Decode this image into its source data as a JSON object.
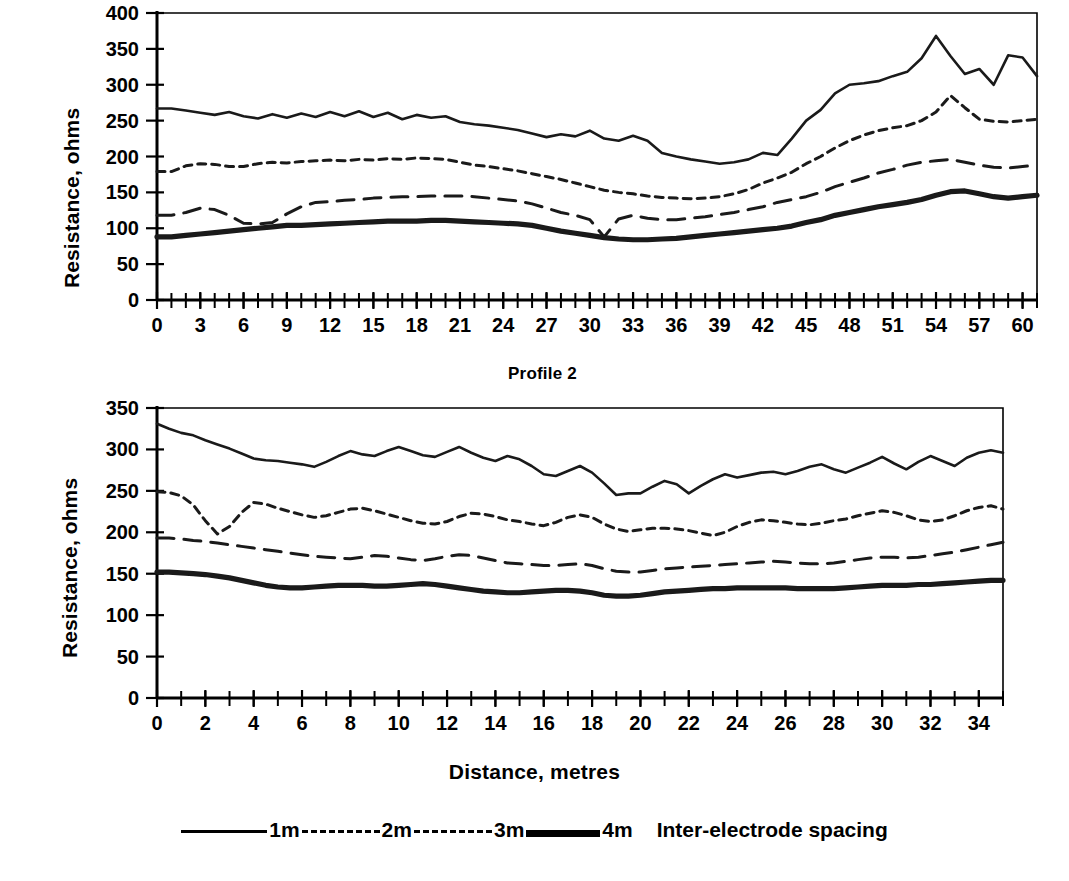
{
  "figure": {
    "xlabel": "Distance, metres",
    "legend_note": "Inter-electrode spacing",
    "legend": [
      {
        "key": "1m",
        "label": "1m",
        "style": "solid-thin"
      },
      {
        "key": "2m",
        "label": "2m",
        "style": "dotted"
      },
      {
        "key": "3m",
        "label": "3m",
        "style": "dashed"
      },
      {
        "key": "4m",
        "label": "4m",
        "style": "solid-thick"
      }
    ]
  },
  "chart_data": [
    {
      "id": "profile-1",
      "type": "line",
      "title": "",
      "xlabel": "",
      "ylabel": "Resistance, ohms",
      "xlim": [
        0,
        61
      ],
      "ylim": [
        0,
        400
      ],
      "yticks": [
        0,
        50,
        100,
        150,
        200,
        250,
        300,
        350,
        400
      ],
      "xticks": [
        0,
        3,
        6,
        9,
        12,
        15,
        18,
        21,
        24,
        27,
        30,
        33,
        36,
        39,
        42,
        45,
        48,
        51,
        54,
        57,
        60
      ],
      "xtick_minor_step": 1,
      "grid": false,
      "legend_position": "below-figure",
      "x": [
        0,
        1,
        2,
        3,
        4,
        5,
        6,
        7,
        8,
        9,
        10,
        11,
        12,
        13,
        14,
        15,
        16,
        17,
        18,
        19,
        20,
        21,
        22,
        23,
        24,
        25,
        26,
        27,
        28,
        29,
        30,
        31,
        32,
        33,
        34,
        35,
        36,
        37,
        38,
        39,
        40,
        41,
        42,
        43,
        44,
        45,
        46,
        47,
        48,
        49,
        50,
        51,
        52,
        53,
        54,
        55,
        56,
        57,
        58,
        59,
        60,
        61
      ],
      "series": [
        {
          "name": "1m",
          "values": [
            267,
            267,
            264,
            261,
            258,
            262,
            256,
            253,
            259,
            254,
            260,
            255,
            262,
            256,
            263,
            255,
            261,
            252,
            258,
            254,
            256,
            248,
            245,
            243,
            240,
            237,
            232,
            227,
            231,
            228,
            236,
            225,
            222,
            229,
            222,
            205,
            200,
            196,
            193,
            190,
            192,
            196,
            205,
            202,
            225,
            250,
            265,
            288,
            300,
            302,
            305,
            312,
            318,
            337,
            368,
            340,
            315,
            322,
            300,
            341,
            338,
            312,
            295,
            283,
            262,
            232,
            228,
            235,
            240,
            250,
            272,
            295,
            312,
            318,
            328,
            320,
            310,
            322,
            340,
            338,
            330,
            352,
            357,
            323
          ]
        },
        {
          "name": "2m",
          "values": [
            179,
            179,
            187,
            190,
            189,
            186,
            186,
            190,
            192,
            191,
            193,
            194,
            195,
            194,
            196,
            195,
            197,
            196,
            198,
            197,
            196,
            192,
            188,
            186,
            183,
            180,
            176,
            172,
            168,
            163,
            158,
            153,
            150,
            148,
            145,
            143,
            142,
            141,
            142,
            144,
            148,
            154,
            163,
            170,
            178,
            190,
            200,
            212,
            222,
            230,
            236,
            240,
            243,
            250,
            262,
            285,
            268,
            252,
            249,
            248,
            250,
            252,
            246,
            240,
            228,
            214,
            205,
            197,
            198,
            204,
            212,
            222,
            232,
            240,
            248,
            252,
            254,
            253,
            252,
            255,
            258,
            260,
            262,
            263
          ]
        },
        {
          "name": "3m",
          "values": [
            118,
            118,
            122,
            128,
            126,
            118,
            107,
            106,
            108,
            120,
            130,
            136,
            137,
            139,
            140,
            142,
            143,
            144,
            144,
            145,
            145,
            145,
            144,
            142,
            140,
            138,
            134,
            128,
            122,
            118,
            112,
            88,
            113,
            118,
            114,
            112,
            112,
            114,
            116,
            119,
            122,
            126,
            130,
            136,
            140,
            144,
            150,
            158,
            164,
            170,
            177,
            182,
            188,
            192,
            194,
            196,
            192,
            188,
            185,
            184,
            186,
            188,
            190,
            184,
            176,
            166,
            162,
            161,
            162,
            166,
            172,
            178,
            180,
            182,
            184,
            186,
            186,
            185,
            184,
            186,
            190,
            196,
            206,
            217
          ]
        },
        {
          "name": "4m",
          "values": [
            88,
            88,
            90,
            92,
            94,
            96,
            98,
            100,
            102,
            104,
            104,
            105,
            106,
            107,
            108,
            109,
            110,
            110,
            110,
            111,
            111,
            110,
            109,
            108,
            107,
            106,
            104,
            100,
            96,
            93,
            90,
            87,
            85,
            84,
            84,
            85,
            86,
            88,
            90,
            92,
            94,
            96,
            98,
            100,
            103,
            108,
            112,
            118,
            122,
            126,
            130,
            133,
            136,
            140,
            146,
            151,
            152,
            148,
            144,
            142,
            144,
            146,
            148,
            146,
            140,
            133,
            129,
            128,
            130,
            134,
            138,
            142,
            146,
            148,
            150,
            151,
            151,
            150,
            150,
            152,
            154,
            160,
            170,
            180
          ]
        }
      ]
    },
    {
      "id": "profile-2",
      "type": "line",
      "title": "Profile 2",
      "xlabel": "Distance, metres",
      "ylabel": "Resistance, ohms",
      "xlim": [
        0,
        35
      ],
      "ylim": [
        0,
        350
      ],
      "yticks": [
        0,
        50,
        100,
        150,
        200,
        250,
        300,
        350
      ],
      "xticks": [
        0,
        2,
        4,
        6,
        8,
        10,
        12,
        14,
        16,
        18,
        20,
        22,
        24,
        26,
        28,
        30,
        32,
        34
      ],
      "xtick_minor_step": 1,
      "grid": false,
      "legend_position": "below-figure",
      "x": [
        0,
        0.5,
        1,
        1.5,
        2,
        2.5,
        3,
        3.5,
        4,
        4.5,
        5,
        5.5,
        6,
        6.5,
        7,
        7.5,
        8,
        8.5,
        9,
        9.5,
        10,
        10.5,
        11,
        11.5,
        12,
        12.5,
        13,
        13.5,
        14,
        14.5,
        15,
        15.5,
        16,
        16.5,
        17,
        17.5,
        18,
        18.5,
        19,
        19.5,
        20,
        20.5,
        21,
        21.5,
        22,
        22.5,
        23,
        23.5,
        24,
        24.5,
        25,
        25.5,
        26,
        26.5,
        27,
        27.5,
        28,
        28.5,
        29,
        29.5,
        30,
        30.5,
        31,
        31.5,
        32,
        32.5,
        33,
        33.5,
        34,
        34.5,
        35
      ],
      "series": [
        {
          "name": "1m",
          "values": [
            331,
            325,
            320,
            317,
            311,
            306,
            301,
            295,
            289,
            287,
            286,
            284,
            282,
            279,
            285,
            292,
            298,
            294,
            292,
            298,
            303,
            298,
            293,
            291,
            297,
            303,
            296,
            290,
            286,
            292,
            288,
            280,
            270,
            268,
            274,
            280,
            272,
            259,
            245,
            247,
            247,
            255,
            262,
            258,
            247,
            256,
            264,
            270,
            266,
            269,
            272,
            273,
            270,
            274,
            279,
            282,
            276,
            272,
            278,
            284,
            291,
            283,
            276,
            285,
            292,
            286,
            280,
            290,
            296,
            299,
            296
          ]
        },
        {
          "name": "2m",
          "values": [
            249,
            248,
            244,
            233,
            214,
            198,
            207,
            224,
            236,
            234,
            229,
            225,
            221,
            218,
            220,
            224,
            228,
            229,
            226,
            222,
            218,
            214,
            211,
            210,
            213,
            219,
            223,
            222,
            219,
            215,
            213,
            210,
            208,
            212,
            218,
            221,
            218,
            210,
            204,
            201,
            203,
            205,
            205,
            204,
            202,
            199,
            196,
            200,
            207,
            212,
            215,
            214,
            212,
            210,
            209,
            211,
            214,
            216,
            220,
            223,
            226,
            224,
            220,
            215,
            213,
            215,
            220,
            226,
            230,
            232,
            228
          ]
        },
        {
          "name": "3m",
          "values": [
            193,
            193,
            192,
            190,
            189,
            187,
            185,
            183,
            181,
            179,
            177,
            175,
            173,
            171,
            170,
            169,
            168,
            170,
            172,
            171,
            169,
            167,
            166,
            168,
            171,
            173,
            172,
            169,
            166,
            163,
            162,
            161,
            160,
            160,
            161,
            162,
            160,
            156,
            153,
            152,
            152,
            154,
            156,
            157,
            158,
            159,
            160,
            161,
            162,
            163,
            164,
            165,
            164,
            163,
            162,
            162,
            163,
            165,
            167,
            169,
            170,
            170,
            169,
            170,
            172,
            174,
            176,
            179,
            182,
            185,
            188
          ]
        },
        {
          "name": "4m",
          "values": [
            152,
            152,
            151,
            150,
            149,
            147,
            145,
            142,
            139,
            136,
            134,
            133,
            133,
            134,
            135,
            136,
            136,
            136,
            135,
            135,
            136,
            137,
            138,
            137,
            135,
            133,
            131,
            129,
            128,
            127,
            127,
            128,
            129,
            130,
            130,
            129,
            127,
            124,
            123,
            123,
            124,
            126,
            128,
            129,
            130,
            131,
            132,
            132,
            133,
            133,
            133,
            133,
            133,
            132,
            132,
            132,
            132,
            133,
            134,
            135,
            136,
            136,
            136,
            137,
            137,
            138,
            139,
            140,
            141,
            142,
            142
          ]
        }
      ]
    }
  ]
}
